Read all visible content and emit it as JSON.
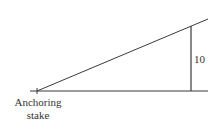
{
  "diagram": {
    "type": "right-triangle",
    "labels": {
      "height": "10",
      "anchor_line1": "Anchoring",
      "anchor_line2": "stake"
    },
    "colors": {
      "line": "#3a3a3a",
      "text": "#333333",
      "background": "#ffffff"
    }
  }
}
